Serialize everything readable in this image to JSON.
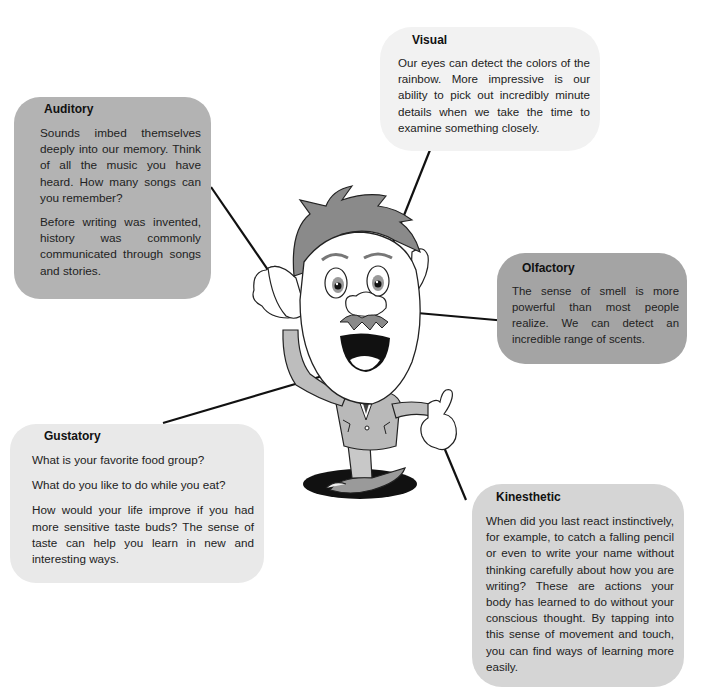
{
  "figure": {
    "topic": "The five senses and learning",
    "center_illustration": "cartoon-man"
  },
  "boxes": {
    "visual": {
      "title": "Visual",
      "paragraphs": [
        "Our eyes can detect the colors of the rainbow. More impressive is our ability to pick out incredibly minute details when we take the time to examine something closely."
      ],
      "points_to": "eye",
      "fill": "#f2f2f2"
    },
    "auditory": {
      "title": "Auditory",
      "paragraphs": [
        "Sounds imbed themselves deeply into our memory. Think of all the music you have heard. How many songs can you remember?",
        "Before writing was invented, history was commonly communicated through songs and stories."
      ],
      "points_to": "ear",
      "fill": "#b3b3b3"
    },
    "olfactory": {
      "title": "Olfactory",
      "paragraphs": [
        "The sense of smell is more powerful than most people realize. We can detect an incredible range of scents."
      ],
      "points_to": "nose",
      "fill": "#a4a4a4"
    },
    "gustatory": {
      "title": "Gustatory",
      "paragraphs": [
        "What is your favorite food group?",
        "What do you like to do while you eat?",
        "How would your life improve if you had more sensitive taste buds? The sense of taste can help you learn in new and interesting ways."
      ],
      "points_to": "mouth",
      "fill": "#e9e9e9"
    },
    "kinesthetic": {
      "title": "Kinesthetic",
      "paragraphs": [
        "When did you last react instinctively, for example, to catch a falling pencil or even to write your name without thinking carefully about how you are writing? These are actions your body has learned to do without your conscious thought. By tapping into this sense of movement and touch, you can find ways of learning more easily."
      ],
      "points_to": "hand",
      "fill": "#d5d5d5"
    }
  },
  "colors": {
    "line": "#111111",
    "hair": "#8a8a8a",
    "suit": "#b9b9b9",
    "shadow": "#111111"
  }
}
